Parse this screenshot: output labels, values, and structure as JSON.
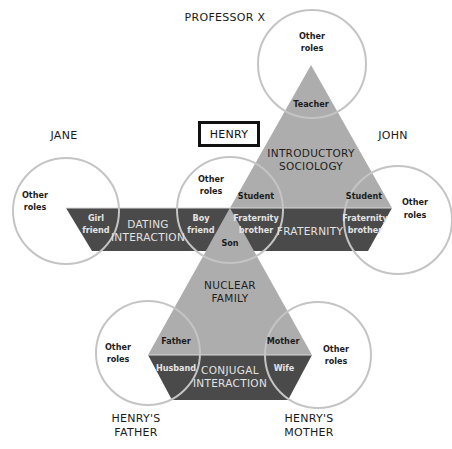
{
  "diagram": {
    "colors": {
      "group_light": "#adadad",
      "group_dark": "#4a4a4a",
      "circle_outline": "#c4c4c4",
      "background": "#ffffff"
    },
    "focal_person": "HENRY",
    "persons": {
      "professor_x": "PROFESSOR X",
      "jane": "JANE",
      "john": "JOHN",
      "father_line1": "HENRY'S",
      "father_line2": "FATHER",
      "mother_line1": "HENRY'S",
      "mother_line2": "MOTHER"
    },
    "groups": {
      "intro_soc_line1": "INTRODUCTORY",
      "intro_soc_line2": "SOCIOLOGY",
      "dating_line1": "DATING",
      "dating_line2": "INTERACTION",
      "fraternity": "FRATERNITY",
      "nuclear_line1": "NUCLEAR",
      "nuclear_line2": "FAMILY",
      "conjugal_line1": "CONJUGAL",
      "conjugal_line2": "INTERACTION"
    },
    "roles": {
      "other_line1": "Other",
      "other_line2": "roles",
      "teacher": "Teacher",
      "student": "Student",
      "girl_line1": "Girl",
      "girl_line2": "friend",
      "boy_line1": "Boy",
      "boy_line2": "friend",
      "frat_line1": "Fraternity",
      "frat_line2": "brother",
      "son": "Son",
      "father": "Father",
      "mother": "Mother",
      "husband": "Husband",
      "wife": "Wife"
    }
  }
}
